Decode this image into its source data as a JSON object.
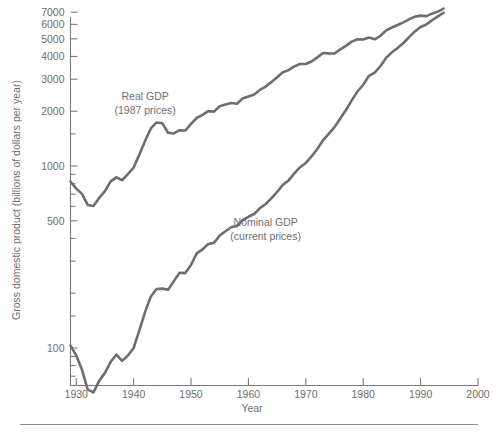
{
  "chart_data": {
    "type": "line",
    "title": "",
    "xlabel": "Year",
    "ylabel": "Gross domestic product (billions of dollars per year)",
    "yscale": "log",
    "xlim": [
      1929,
      2000
    ],
    "ylim": [
      60,
      7500
    ],
    "grid": false,
    "legend_position": "inline-annotations",
    "xticks": [
      1930,
      1940,
      1950,
      1960,
      1970,
      1980,
      1990,
      2000
    ],
    "xticklabels": [
      "1930",
      "1940",
      "1950",
      "1960",
      "1970",
      "1980",
      "1990",
      "2000"
    ],
    "yticks": [
      100,
      500,
      1000,
      2000,
      3000,
      4000,
      5000,
      6000,
      7000
    ],
    "yticklabels": [
      "100",
      "500",
      "1000",
      "2000",
      "3000",
      "4000",
      "5000",
      "6000",
      "7000"
    ],
    "yticks_minor": [
      200,
      300,
      400,
      600,
      700,
      800,
      900,
      1500
    ],
    "annotations": [
      {
        "name": "real-gdp-label",
        "lines": [
          "Real GDP",
          "(1987 prices)"
        ],
        "x": 1942,
        "y": 2300
      },
      {
        "name": "nominal-gdp-label",
        "lines": [
          "Nominal GDP",
          "(current prices)"
        ],
        "x": 1963,
        "y": 470
      }
    ],
    "series": [
      {
        "name": "Real GDP (1987 prices)",
        "color": "#6e6e6e",
        "x": [
          1929,
          1930,
          1931,
          1932,
          1933,
          1934,
          1935,
          1936,
          1937,
          1938,
          1939,
          1940,
          1941,
          1942,
          1943,
          1944,
          1945,
          1946,
          1947,
          1948,
          1949,
          1950,
          1951,
          1952,
          1953,
          1954,
          1955,
          1956,
          1957,
          1958,
          1959,
          1960,
          1961,
          1962,
          1963,
          1964,
          1965,
          1966,
          1967,
          1968,
          1969,
          1970,
          1971,
          1972,
          1973,
          1974,
          1975,
          1976,
          1977,
          1978,
          1979,
          1980,
          1981,
          1982,
          1983,
          1984,
          1985,
          1986,
          1987,
          1988,
          1989,
          1990,
          1991,
          1992,
          1993,
          1994
        ],
        "y": [
          822,
          751,
          703,
          611,
          603,
          668,
          728,
          823,
          866,
          835,
          903,
          981,
          1155,
          1374,
          1610,
          1735,
          1717,
          1524,
          1509,
          1573,
          1566,
          1703,
          1836,
          1910,
          2002,
          1989,
          2130,
          2174,
          2217,
          2199,
          2348,
          2407,
          2468,
          2617,
          2732,
          2890,
          3075,
          3275,
          3364,
          3525,
          3635,
          3636,
          3753,
          3952,
          4179,
          4158,
          4151,
          4374,
          4574,
          4822,
          4973,
          4958,
          5082,
          4969,
          5192,
          5563,
          5766,
          5950,
          6150,
          6400,
          6620,
          6700,
          6660,
          6870,
          7050,
          7330
        ]
      },
      {
        "name": "Nominal GDP (current prices)",
        "color": "#6e6e6e",
        "x": [
          1929,
          1930,
          1931,
          1932,
          1933,
          1934,
          1935,
          1936,
          1937,
          1938,
          1939,
          1940,
          1941,
          1942,
          1943,
          1944,
          1945,
          1946,
          1947,
          1948,
          1949,
          1950,
          1951,
          1952,
          1953,
          1954,
          1955,
          1956,
          1957,
          1958,
          1959,
          1960,
          1961,
          1962,
          1963,
          1964,
          1965,
          1966,
          1967,
          1968,
          1969,
          1970,
          1971,
          1972,
          1973,
          1974,
          1975,
          1976,
          1977,
          1978,
          1979,
          1980,
          1981,
          1982,
          1983,
          1984,
          1985,
          1986,
          1987,
          1988,
          1989,
          1990,
          1991,
          1992,
          1993,
          1994
        ],
        "y": [
          103,
          91,
          76,
          59,
          57,
          66,
          73,
          84,
          92,
          85,
          91,
          100,
          125,
          158,
          192,
          211,
          212,
          209,
          233,
          259,
          258,
          286,
          331,
          348,
          373,
          378,
          415,
          438,
          461,
          468,
          505,
          526,
          545,
          586,
          618,
          664,
          720,
          788,
          833,
          910,
          985,
          1039,
          1128,
          1241,
          1386,
          1501,
          1635,
          1824,
          2031,
          2295,
          2566,
          2796,
          3131,
          3259,
          3535,
          3933,
          4213,
          4453,
          4742,
          5109,
          5489,
          5803,
          5986,
          6319,
          6642,
          6947
        ]
      }
    ]
  },
  "footer": {
    "rule": true
  }
}
